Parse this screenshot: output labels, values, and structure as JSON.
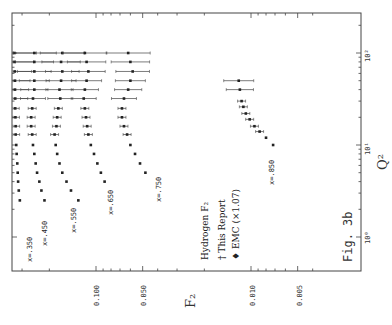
{
  "figure": {
    "label": "Fig. 3b",
    "legend": {
      "title": "Hydrogen F₂",
      "entries": [
        {
          "marker": "†",
          "label": "This Report"
        },
        {
          "marker": "♦",
          "label": "EMC (×1.07)"
        }
      ]
    },
    "axes": {
      "x_title": "Q²",
      "y_title": "F₂",
      "x_ticks": [
        "10⁰",
        "10¹",
        "10²"
      ],
      "y_ticks": [
        "0.100",
        "0.050",
        "0.010",
        "0.005"
      ]
    },
    "series_labels": [
      "x=.350",
      "x=.450",
      "x=.550",
      "x=.650",
      "x=.750",
      "x=.850"
    ]
  },
  "chart_data": {
    "type": "scatter",
    "caption": "Fig. 3b",
    "xlabel": "Q^2",
    "ylabel": "F2",
    "xscale": "log",
    "yscale": "log",
    "xlim": [
      0.8,
      150
    ],
    "ylim": [
      0.003,
      0.45
    ],
    "orientation_note": "plot rotated 90 degrees counter-clockwise; Q^2 axis on right edge, F2 axis along bottom",
    "x_ticks": [
      1,
      10,
      100
    ],
    "y_ticks": [
      0.1,
      0.05,
      0.01,
      0.005
    ],
    "legend": [
      "This Report",
      "EMC (x1.07)"
    ],
    "series": [
      {
        "name": "x=.350",
        "Q2": [
          2.5,
          3.2,
          4.0,
          5.0,
          6.3,
          8.0,
          10,
          13,
          16,
          20,
          25,
          32,
          40,
          50,
          63,
          80,
          100
        ],
        "F2": [
          0.31,
          0.315,
          0.318,
          0.32,
          0.322,
          0.325,
          0.327,
          0.33,
          0.33,
          0.331,
          0.332,
          0.332,
          0.333,
          0.333,
          0.334,
          0.335,
          0.336
        ]
      },
      {
        "name": "x=.450",
        "Q2": [
          2.5,
          3.2,
          4.0,
          5.0,
          6.3,
          8.0,
          10,
          13,
          16,
          20,
          25,
          32,
          40,
          50,
          63,
          80,
          100
        ],
        "F2": [
          0.215,
          0.225,
          0.232,
          0.24,
          0.245,
          0.25,
          0.255,
          0.258,
          0.262,
          0.262,
          0.258,
          0.255,
          0.25,
          0.25,
          0.25,
          0.25,
          0.25
        ]
      },
      {
        "name": "x=.550",
        "Q2": [
          2.5,
          3.2,
          4.0,
          5.0,
          6.3,
          8.0,
          10,
          13,
          16,
          20,
          25,
          32,
          40,
          50,
          63,
          80,
          100
        ],
        "F2": [
          0.13,
          0.145,
          0.155,
          0.165,
          0.172,
          0.178,
          0.182,
          0.185,
          0.18,
          0.178,
          0.175,
          0.17,
          0.172,
          0.168,
          0.165,
          0.168,
          0.165
        ]
      },
      {
        "name": "x=.650",
        "Q2": [
          4.0,
          5.0,
          6.3,
          8.0,
          10,
          13,
          16,
          20,
          25,
          32,
          40,
          50,
          63,
          80,
          100
        ],
        "F2": [
          0.088,
          0.093,
          0.098,
          0.103,
          0.108,
          0.112,
          0.114,
          0.116,
          0.118,
          0.12,
          0.118,
          0.115,
          0.112,
          0.115,
          0.118
        ]
      },
      {
        "name": "x=.750",
        "Q2": [
          5.0,
          6.3,
          8.0,
          10,
          13,
          16,
          20,
          25,
          32,
          40,
          50,
          63,
          80,
          100
        ],
        "F2": [
          0.048,
          0.052,
          0.056,
          0.06,
          0.063,
          0.066,
          0.068,
          0.068,
          0.066,
          0.062,
          0.06,
          0.058,
          0.06,
          0.062
        ]
      },
      {
        "name": "x=.850",
        "Q2": [
          10,
          12,
          14,
          16,
          19,
          22,
          26,
          30,
          40,
          50
        ],
        "F2": [
          0.0072,
          0.008,
          0.0088,
          0.0095,
          0.0102,
          0.0108,
          0.0112,
          0.0115,
          0.0118,
          0.012
        ]
      }
    ]
  }
}
